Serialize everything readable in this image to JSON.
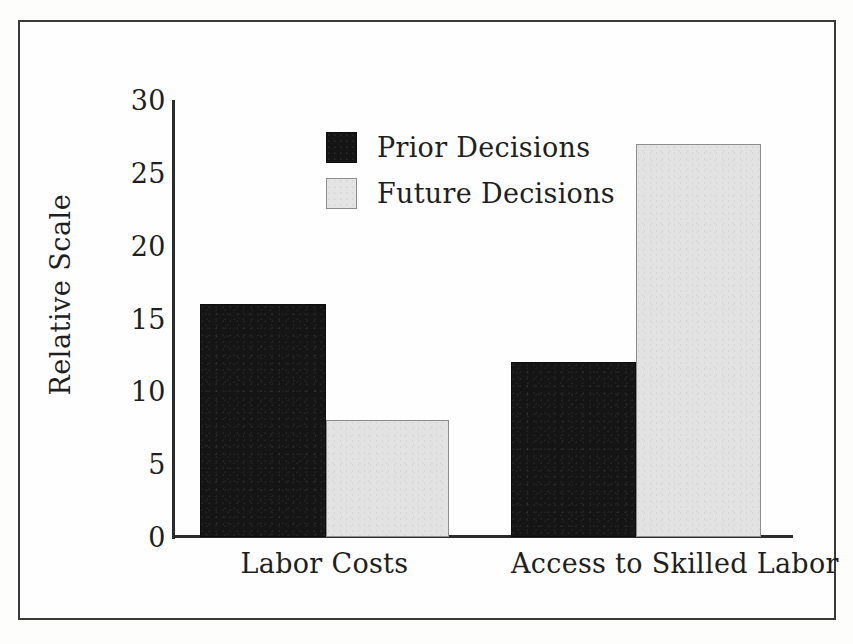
{
  "chart_data": {
    "type": "bar",
    "title": "",
    "xlabel": "",
    "ylabel": "Relative Scale",
    "ylim": [
      0,
      30
    ],
    "ytick_labels": [
      "30",
      "25",
      "20",
      "15",
      "10",
      "5",
      "0"
    ],
    "ytick_values": [
      30,
      25,
      20,
      15,
      10,
      5,
      0
    ],
    "grid": false,
    "legend_position": "inside upper-left-center",
    "categories": [
      "Labor Costs",
      "Access to Skilled Labor"
    ],
    "series": [
      {
        "name": "Prior Decisions",
        "color": "#151515",
        "values": [
          16,
          12
        ]
      },
      {
        "name": "Future Decisions",
        "color": "#e2e2e2",
        "values": [
          8,
          27
        ]
      }
    ]
  },
  "figure": {
    "frame_color": "#3a3a3a",
    "axis_color": "#2b2b2b",
    "background": "#fefefe"
  }
}
